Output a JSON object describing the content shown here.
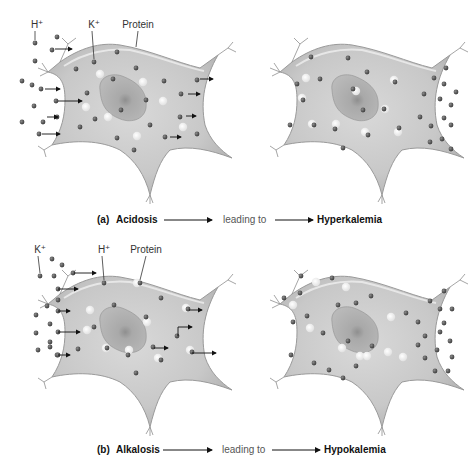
{
  "panels": [
    {
      "id": "a",
      "caption": {
        "letter": "(a)",
        "condition": "Acidosis",
        "middle": "leading to",
        "result": "Hyperkalemia"
      },
      "labels": [
        {
          "text": "H+",
          "x": 37,
          "y": 28,
          "lineTo": [
            35,
            43
          ]
        },
        {
          "text": "K+",
          "x": 94,
          "y": 28,
          "lineTo": [
            94,
            62
          ]
        },
        {
          "text": "Protein",
          "x": 138,
          "y": 28,
          "lineTo": [
            136,
            50
          ]
        }
      ],
      "left_cell": {
        "offset": [
          0,
          0
        ],
        "outside_dots": [
          [
            35,
            43
          ],
          [
            57,
            37
          ],
          [
            35,
            61
          ],
          [
            22,
            81
          ],
          [
            32,
            85
          ],
          [
            41,
            89
          ],
          [
            34,
            106
          ],
          [
            22,
            122
          ],
          [
            43,
            122
          ],
          [
            39,
            134
          ],
          [
            57,
            117
          ],
          [
            56,
            101
          ],
          [
            52,
            50
          ]
        ],
        "inside_dots": [
          [
            117,
            52
          ],
          [
            136,
            68
          ],
          [
            94,
            62
          ],
          [
            76,
            69
          ],
          [
            113,
            79
          ],
          [
            87,
            93
          ],
          [
            146,
            100
          ],
          [
            121,
            110
          ],
          [
            95,
            119
          ],
          [
            80,
            127
          ],
          [
            150,
            125
          ],
          [
            117,
            138
          ],
          [
            134,
            150
          ],
          [
            164,
            81
          ],
          [
            197,
            80
          ],
          [
            181,
            94
          ],
          [
            180,
            117
          ],
          [
            197,
            134
          ],
          [
            165,
            137
          ]
        ],
        "protein_dots": [
          [
            100,
            74
          ],
          [
            143,
            82
          ],
          [
            86,
            107
          ],
          [
            108,
            117
          ],
          [
            137,
            136
          ],
          [
            163,
            101
          ],
          [
            183,
            127
          ]
        ],
        "arrows": [
          [
            55,
            49,
            72,
            49
          ],
          [
            45,
            89,
            60,
            89
          ],
          [
            58,
            101,
            82,
            101
          ],
          [
            47,
            117,
            58,
            117
          ],
          [
            42,
            134,
            60,
            134
          ],
          [
            200,
            79,
            213,
            79
          ],
          [
            188,
            94,
            200,
            94
          ],
          [
            186,
            116,
            196,
            116
          ],
          [
            170,
            137,
            181,
            137
          ]
        ]
      },
      "right_cell": {
        "offset": [
          232,
          0
        ],
        "outside_dots": [
          [
            214,
            68
          ],
          [
            202,
            78
          ],
          [
            212,
            84
          ],
          [
            224,
            92
          ],
          [
            192,
            94
          ],
          [
            208,
            99
          ],
          [
            219,
            105
          ],
          [
            188,
            117
          ],
          [
            199,
            126
          ],
          [
            212,
            118
          ],
          [
            219,
            125
          ],
          [
            198,
            142
          ],
          [
            210,
            139
          ],
          [
            219,
            149
          ]
        ],
        "inside_dots": [
          [
            79,
            57
          ],
          [
            116,
            58
          ],
          [
            135,
            72
          ],
          [
            65,
            84
          ],
          [
            88,
            79
          ],
          [
            71,
            100
          ],
          [
            121,
            89
          ],
          [
            131,
            110
          ],
          [
            152,
            109
          ],
          [
            163,
            82
          ],
          [
            58,
            125
          ],
          [
            82,
            125
          ],
          [
            103,
            129
          ],
          [
            136,
            135
          ],
          [
            167,
            128
          ],
          [
            111,
            148
          ]
        ],
        "protein_dots": [
          [
            74,
            78
          ],
          [
            162,
            80
          ],
          [
            70,
            98
          ],
          [
            124,
            91
          ],
          [
            80,
            124
          ],
          [
            104,
            124
          ],
          [
            133,
            132
          ],
          [
            166,
            132
          ],
          [
            153,
            109
          ]
        ]
      }
    },
    {
      "id": "b",
      "caption": {
        "letter": "(b)",
        "condition": "Alkalosis",
        "middle": "leading to",
        "result": "Hypokalemia"
      },
      "labels": [
        {
          "text": "K+",
          "x": 40,
          "y": 253,
          "lineTo": [
            40,
            276
          ]
        },
        {
          "text": "H+",
          "x": 104,
          "y": 253,
          "lineTo": [
            104,
            283
          ]
        },
        {
          "text": "Protein",
          "x": 146,
          "y": 253,
          "lineTo": [
            140,
            283
          ]
        }
      ],
      "left_cell": {
        "offset": [
          0,
          0
        ],
        "outside_dots": [
          [
            52,
            259
          ],
          [
            62,
            265
          ],
          [
            40,
            276
          ],
          [
            54,
            276
          ],
          [
            73,
            273
          ],
          [
            58,
            289
          ],
          [
            47,
            306
          ],
          [
            36,
            315
          ],
          [
            50,
            324
          ],
          [
            36,
            333
          ],
          [
            50,
            342
          ],
          [
            38,
            350
          ],
          [
            50,
            347
          ],
          [
            58,
            355
          ],
          [
            58,
            332
          ],
          [
            58,
            311
          ],
          [
            58,
            300
          ]
        ],
        "inside_dots": [
          [
            104,
            283
          ],
          [
            140,
            283
          ],
          [
            161,
            298
          ],
          [
            114,
            305
          ],
          [
            146,
            317
          ],
          [
            94,
            327
          ],
          [
            78,
            349
          ],
          [
            107,
            348
          ],
          [
            128,
            355
          ],
          [
            153,
            347
          ],
          [
            136,
            373
          ],
          [
            161,
            360
          ],
          [
            188,
            309
          ],
          [
            177,
            336
          ],
          [
            192,
            352
          ],
          [
            57,
            355
          ]
        ],
        "protein_dots": [
          [
            90,
            310
          ],
          [
            137,
            283
          ],
          [
            87,
            330
          ],
          [
            147,
            322
          ],
          [
            186,
            308
          ],
          [
            129,
            350
          ],
          [
            158,
            358
          ],
          [
            190,
            350
          ],
          [
            106,
            348
          ]
        ],
        "arrows": [
          [
            74,
            273,
            96,
            273
          ],
          [
            58,
            289,
            78,
            289
          ],
          [
            58,
            311,
            70,
            311
          ],
          [
            58,
            332,
            80,
            332
          ],
          [
            58,
            355,
            70,
            355
          ],
          [
            189,
            310,
            202,
            310
          ],
          [
            178,
            336,
            178,
            327,
            192,
            327
          ],
          [
            154,
            348,
            168,
            348
          ],
          [
            192,
            353,
            216,
            353
          ]
        ]
      },
      "right_cell": {
        "offset": [
          232,
          0
        ],
        "outside_dots": [
          [
            212,
            291
          ],
          [
            198,
            301
          ],
          [
            208,
            309
          ],
          [
            220,
            309
          ],
          [
            186,
            322
          ],
          [
            212,
            323
          ],
          [
            193,
            336
          ],
          [
            208,
            332
          ],
          [
            218,
            341
          ],
          [
            186,
            345
          ],
          [
            205,
            350
          ],
          [
            193,
            358
          ],
          [
            220,
            357
          ],
          [
            203,
            371
          ],
          [
            216,
            371
          ]
        ],
        "inside_dots": [
          [
            69,
            276
          ],
          [
            100,
            278
          ],
          [
            68,
            293
          ],
          [
            52,
            298
          ],
          [
            124,
            303
          ],
          [
            139,
            296
          ],
          [
            106,
            305
          ],
          [
            75,
            316
          ],
          [
            61,
            322
          ],
          [
            91,
            333
          ],
          [
            116,
            341
          ],
          [
            140,
            346
          ],
          [
            174,
            313
          ],
          [
            59,
            355
          ],
          [
            82,
            363
          ],
          [
            97,
            370
          ],
          [
            124,
            366
          ],
          [
            111,
            378
          ]
        ],
        "protein_dots": [
          [
            84,
            282
          ],
          [
            114,
            287
          ],
          [
            61,
            305
          ],
          [
            78,
            328
          ],
          [
            110,
            348
          ],
          [
            128,
            356
          ],
          [
            159,
            317
          ],
          [
            156,
            352
          ],
          [
            135,
            356
          ],
          [
            171,
            357
          ]
        ]
      }
    }
  ]
}
